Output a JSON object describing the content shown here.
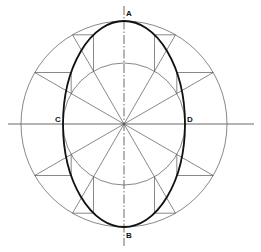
{
  "diagram": {
    "labels": {
      "A": "A",
      "B": "B",
      "C": "C",
      "D": "D"
    },
    "geometry": {
      "center": [
        124,
        124
      ],
      "major_radius": 103,
      "minor_radius": 61,
      "major_axis": "vertical (A-B)",
      "minor_axis": "horizontal (C-D)",
      "radial_division_degrees": 30
    },
    "colors": {
      "construction_line": "#555555",
      "ellipse": "#111111",
      "background": "#ffffff"
    }
  }
}
